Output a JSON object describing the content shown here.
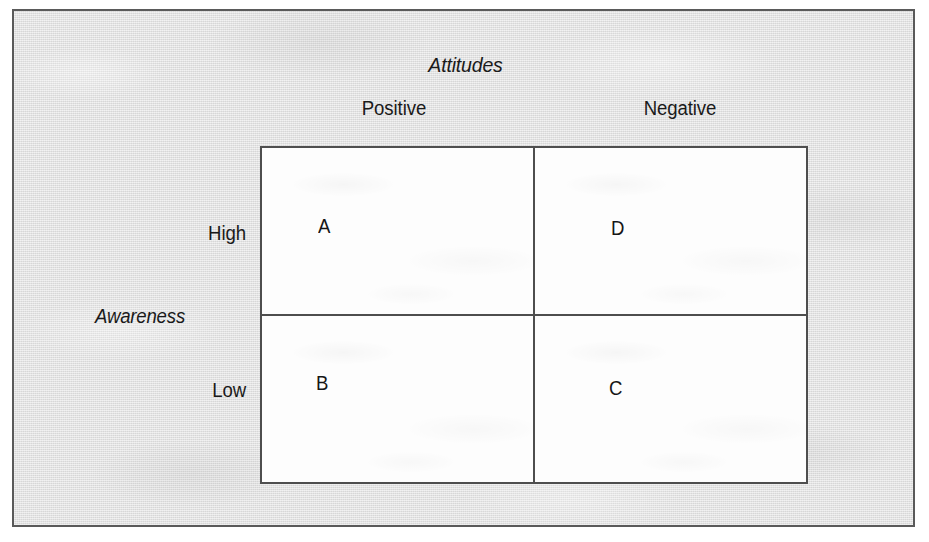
{
  "figure": {
    "column_axis_title": "Attitudes",
    "row_axis_title": "Awareness",
    "column_headers": [
      {
        "label": "Positive"
      },
      {
        "label": "Negative"
      }
    ],
    "row_headers": [
      {
        "label": "High"
      },
      {
        "label": "Low"
      }
    ],
    "quadrants": [
      {
        "id": "a",
        "label": "A",
        "row": "High",
        "column": "Positive"
      },
      {
        "id": "d",
        "label": "D",
        "row": "High",
        "column": "Negative"
      },
      {
        "id": "b",
        "label": "B",
        "row": "Low",
        "column": "Positive"
      },
      {
        "id": "c",
        "label": "C",
        "row": "Low",
        "column": "Negative"
      }
    ]
  },
  "colors": {
    "panel_background": "#e9e9e9",
    "panel_border": "#5a5a5a",
    "cell_background": "#fdfdfd",
    "cell_border": "#4e4e4e",
    "text": "#1a1a1a"
  }
}
